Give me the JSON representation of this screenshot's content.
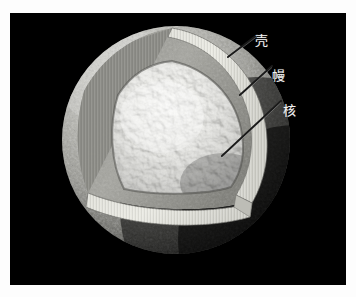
{
  "figure": {
    "kind": "planetary-interior-cutaway-diagram",
    "background_color": "#ffffff",
    "plate_background_color": "#000000",
    "label_color": "#f2f2f2",
    "alt_description": "Cutaway illustration of a rocky planetary body with a wedge removed showing three interior layers"
  },
  "labels": {
    "crust": "壳",
    "mantle": "幔",
    "core": "核"
  },
  "layers": [
    {
      "id": "crust",
      "label": "壳",
      "color": "#c9c9c4",
      "leader_from": [
        228,
        57
      ],
      "leader_to": [
        257,
        35
      ]
    },
    {
      "id": "mantle",
      "label": "幔",
      "color": "#b0b0aa",
      "leader_from": [
        240,
        95
      ],
      "leader_to": [
        272,
        66
      ]
    },
    {
      "id": "core",
      "label": "核",
      "color": "#e3e3dd",
      "leader_from": [
        222,
        156
      ],
      "leader_to": [
        281,
        101
      ]
    }
  ],
  "sphere": {
    "center_x": 176,
    "center_y": 140,
    "radius": 114
  }
}
